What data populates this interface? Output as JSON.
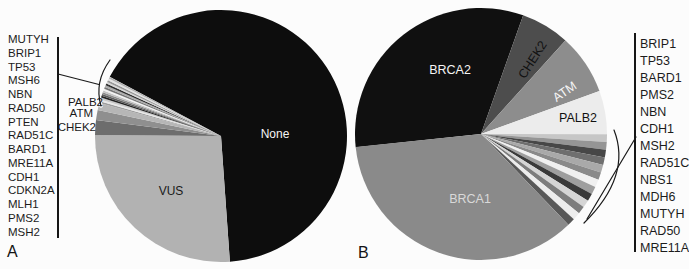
{
  "chart_data": [
    {
      "id": "A",
      "type": "pie",
      "panel_label": "A",
      "start_deg": 298,
      "legend_side": "left",
      "legend_genes": [
        "MUTYH",
        "BRIP1",
        "TP53",
        "MSH6",
        "NBN",
        "RAD50",
        "PTEN",
        "RAD51C",
        "BARD1",
        "MRE11A",
        "CDH1",
        "CDKN2A",
        "MLH1",
        "PMS2",
        "MSH2"
      ],
      "slices": [
        {
          "name": "None",
          "pct": 66.1,
          "color": "#0d0d0d",
          "label": "None",
          "label_color": "#f5f5f5"
        },
        {
          "name": "VUS",
          "pct": 26.25,
          "color": "#b2b2b2",
          "label": "VUS",
          "label_color": "#1a1a1a"
        },
        {
          "name": "CHEK2",
          "pct": 1.89,
          "color": "#6d6d6d",
          "label": "CHEK2",
          "label_color": "#1a1a1a"
        },
        {
          "name": "ATM",
          "pct": 1.28,
          "color": "#8f8f8f",
          "label": "ATM",
          "label_color": "#1a1a1a"
        },
        {
          "name": "PALB2",
          "pct": 0.92,
          "color": "#b6b6b6",
          "label": "PALB2",
          "label_color": "#1a1a1a"
        },
        {
          "name": "MSH2",
          "pct": 0.237,
          "color": "#9e9e9e"
        },
        {
          "name": "PMS2",
          "pct": 0.237,
          "color": "#e8e8e8"
        },
        {
          "name": "MLH1",
          "pct": 0.237,
          "color": "#c9c9c9"
        },
        {
          "name": "CDKN2A",
          "pct": 0.237,
          "color": "#222222"
        },
        {
          "name": "CDH1",
          "pct": 0.237,
          "color": "#5c5c5c"
        },
        {
          "name": "MRE11A",
          "pct": 0.237,
          "color": "#8c8c8c"
        },
        {
          "name": "BARD1",
          "pct": 0.237,
          "color": "#c4c4c4"
        },
        {
          "name": "RAD51C",
          "pct": 0.237,
          "color": "#f2f2f2"
        },
        {
          "name": "PTEN",
          "pct": 0.237,
          "color": "#767676"
        },
        {
          "name": "RAD50",
          "pct": 0.237,
          "color": "#ababab"
        },
        {
          "name": "NBN",
          "pct": 0.237,
          "color": "#303030"
        },
        {
          "name": "MSH6",
          "pct": 0.237,
          "color": "#d6d6d6"
        },
        {
          "name": "TP53",
          "pct": 0.237,
          "color": "#989898"
        },
        {
          "name": "BRIP1",
          "pct": 0.237,
          "color": "#e2e2e2"
        },
        {
          "name": "MUTYH",
          "pct": 0.237,
          "color": "#b0b0b0"
        }
      ]
    },
    {
      "id": "B",
      "type": "pie",
      "panel_label": "B",
      "start_deg": 264,
      "legend_side": "right",
      "legend_genes": [
        "BRIP1",
        "TP53",
        "BARD1",
        "PMS2",
        "NBN",
        "CDH1",
        "MSH2",
        "RAD51C",
        "NBS1",
        "MDH6",
        "MUTYH",
        "RAD50",
        "MRE11A"
      ],
      "slices": [
        {
          "name": "BRCA2",
          "pct": 32.1,
          "color": "#101010",
          "label": "BRCA2",
          "label_color": "#f5f5f5"
        },
        {
          "name": "CHEK2",
          "pct": 6.25,
          "color": "#4d4d4d",
          "label": "CHEK2",
          "label_color": "#111111"
        },
        {
          "name": "ATM",
          "pct": 7.78,
          "color": "#8d8d8d",
          "label": "ATM",
          "label_color": "#f5f5f5"
        },
        {
          "name": "PALB2",
          "pct": 5.56,
          "color": "#ececec",
          "label": "PALB2",
          "label_color": "#111111"
        },
        {
          "name": "BRIP1",
          "pct": 0.983,
          "color": "#c6c6c6"
        },
        {
          "name": "TP53",
          "pct": 0.983,
          "color": "#959595"
        },
        {
          "name": "BARD1",
          "pct": 0.983,
          "color": "#474747"
        },
        {
          "name": "PMS2",
          "pct": 0.983,
          "color": "#6f6f6f"
        },
        {
          "name": "NBN",
          "pct": 0.983,
          "color": "#a9a9a9"
        },
        {
          "name": "CDH1",
          "pct": 0.983,
          "color": "#8a8a8a"
        },
        {
          "name": "MSH2",
          "pct": 0.983,
          "color": "#f0f0f0"
        },
        {
          "name": "RAD51C",
          "pct": 0.983,
          "color": "#9e9e9e"
        },
        {
          "name": "NBS1",
          "pct": 0.983,
          "color": "#3a3a3a"
        },
        {
          "name": "MDH6",
          "pct": 0.983,
          "color": "#d5d5d5"
        },
        {
          "name": "MUTYH",
          "pct": 0.983,
          "color": "#7d7d7d"
        },
        {
          "name": "RAD50",
          "pct": 0.983,
          "color": "#ededed"
        },
        {
          "name": "MRE11A",
          "pct": 0.983,
          "color": "#585858"
        },
        {
          "name": "BRCA1",
          "pct": 35.56,
          "color": "#8a8a8a",
          "label": "BRCA1",
          "label_color": "#d9d9d9"
        }
      ]
    }
  ]
}
